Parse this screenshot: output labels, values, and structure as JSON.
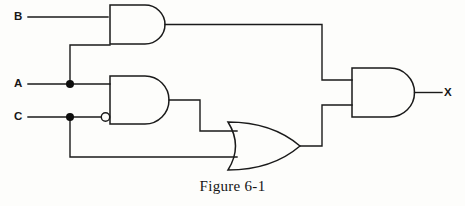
{
  "figure": {
    "caption": "Figure 6-1",
    "type": "logic-circuit-diagram"
  },
  "inputs": [
    {
      "id": "b",
      "label": "B"
    },
    {
      "id": "a",
      "label": "A"
    },
    {
      "id": "c",
      "label": "C"
    }
  ],
  "outputs": [
    {
      "id": "x",
      "label": "X"
    }
  ],
  "gates": [
    {
      "id": "and-top",
      "type": "AND",
      "inputs": [
        "B",
        "A"
      ],
      "inverted_inputs": []
    },
    {
      "id": "and-middle",
      "type": "AND",
      "inputs": [
        "A",
        "C"
      ],
      "inverted_inputs": [
        "C"
      ]
    },
    {
      "id": "or-bottom",
      "type": "OR",
      "inputs": [
        "and-middle",
        "C"
      ],
      "inverted_inputs": []
    },
    {
      "id": "and-output",
      "type": "AND",
      "inputs": [
        "and-top",
        "or-bottom"
      ],
      "inverted_inputs": []
    }
  ],
  "colors": {
    "ink": "#1a1a1a",
    "paper": "#fdfdfb"
  }
}
